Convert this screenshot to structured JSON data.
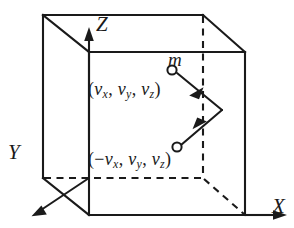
{
  "figure": {
    "background_color": "#ffffff",
    "line_color": "#1a1a1a",
    "axes": [
      {
        "name": "z-axis",
        "label": "Z",
        "direction": "up"
      },
      {
        "name": "x-axis",
        "label": "X",
        "direction": "right"
      },
      {
        "name": "y-axis",
        "label": "Y",
        "direction": "down-left"
      }
    ],
    "labels": {
      "mass": "m",
      "axis_z": "Z",
      "axis_x": "X",
      "axis_y": "Y"
    },
    "velocity_before": {
      "open_paren": "(",
      "vx": "v",
      "vx_sub": "x",
      "comma1": ",",
      "vy": "v",
      "vy_sub": "y",
      "comma2": ",",
      "vz": "v",
      "vz_sub": "z",
      "close_paren": ")",
      "plain_text": "(vx, vy, vz)"
    },
    "velocity_after": {
      "open_paren": "(",
      "minus": "−",
      "vx": "v",
      "vx_sub": "x",
      "comma1": ",",
      "vy": "v",
      "vy_sub": "y",
      "comma2": ",",
      "vz": "v",
      "vz_sub": "z",
      "close_paren": ")",
      "plain_text": "(−vx, vy, vz)"
    },
    "geometry": {
      "cube_front_face": "89,52 245,52 245,215 89,215",
      "cube_back_face": "43,15 203,15 203,178 43,178",
      "solid_edges": [
        "M 43 15 L 203 15",
        "M 43 15 L 43 178",
        "M 43 15 L 89 52",
        "M 203 15 L 245 52",
        "M 43 178 L 89 215",
        "M 89 52 L 245 52",
        "M 89 52 L 89 215",
        "M 245 52 L 245 215",
        "M 89 215 L 245 215"
      ],
      "dashed_edges": [
        "M 203 15 L 203 178",
        "M 43 178 L 203 178",
        "M 203 178 L 245 215"
      ],
      "axis_paths": [
        "M 89 138 L 89 35",
        "M 245 215 L 283 215",
        "M 89 178 L 38 212"
      ],
      "trajectory": "M 175 72 L 222 110 L 180 145",
      "particles": [
        {
          "name": "incoming-particle",
          "cx": 172,
          "cy": 70,
          "r": 5
        },
        {
          "name": "outgoing-particle",
          "cx": 177,
          "cy": 147,
          "r": 5
        }
      ]
    }
  }
}
